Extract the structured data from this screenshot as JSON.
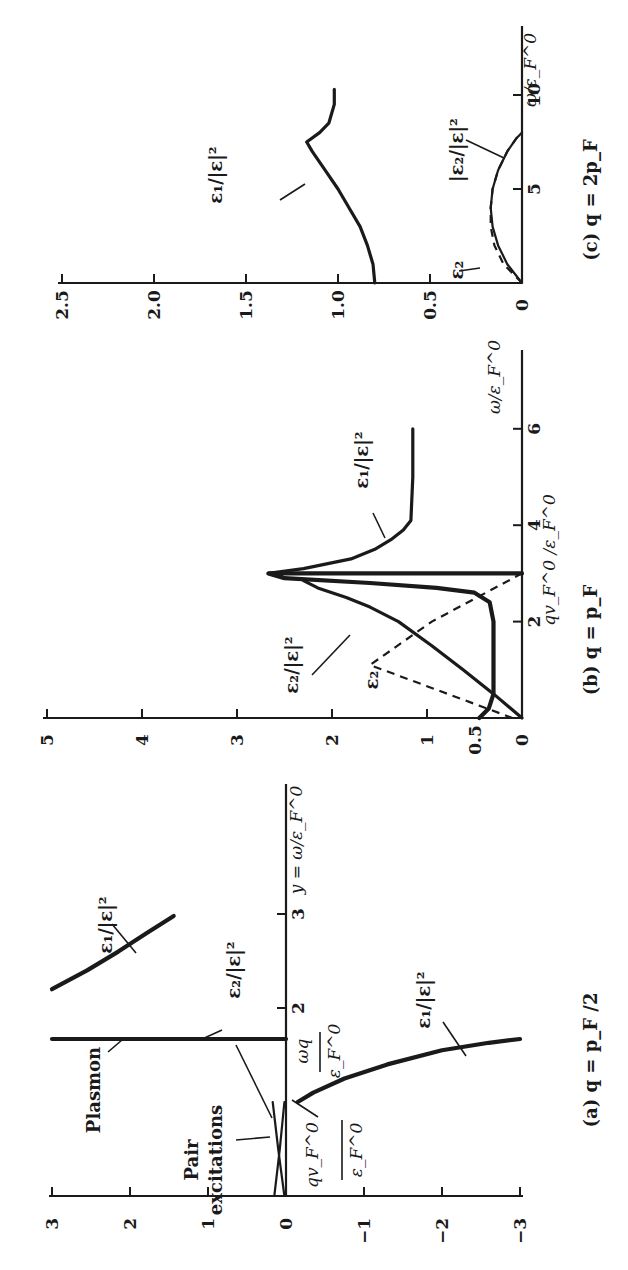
{
  "chart_data": [
    {
      "type": "line",
      "panel": "c",
      "title": "(c) q = 2p_F",
      "xlabel": "ω/ε_F^0",
      "ylabel": "",
      "xlim": [
        0,
        13.5
      ],
      "ylim": [
        0,
        2.5
      ],
      "x_ticks": [
        5,
        10
      ],
      "y_ticks": [
        "0",
        "0.5",
        "1.0",
        "1.5",
        "2.0",
        "2.5"
      ],
      "grid": false,
      "series": [
        {
          "name": "ε₁/|ε|²",
          "style": "solid",
          "x": [
            0,
            1,
            2,
            3,
            4,
            5,
            6,
            7,
            7.5,
            8.0,
            8.5,
            9.5,
            10.3
          ],
          "y": [
            0.8,
            0.81,
            0.84,
            0.88,
            0.94,
            1.0,
            1.07,
            1.14,
            1.17,
            1.1,
            1.05,
            1.02,
            1.02
          ]
        },
        {
          "name": "ε₂/|ε|²",
          "style": "solid",
          "x": [
            0,
            1,
            2,
            3,
            4,
            5,
            6,
            7,
            7.7,
            8.0
          ],
          "y": [
            0,
            0.08,
            0.13,
            0.16,
            0.17,
            0.16,
            0.13,
            0.08,
            0.03,
            0
          ]
        },
        {
          "name": "ε₂",
          "style": "dashed",
          "x": [
            0,
            1,
            2,
            3,
            4,
            5,
            6,
            7,
            7.7,
            8.0
          ],
          "y": [
            0,
            0.1,
            0.15,
            0.17,
            0.17,
            0.16,
            0.13,
            0.08,
            0.03,
            0
          ]
        }
      ],
      "annotations": [
        "ε₁/|ε|²",
        "|ε₂/|ε|²",
        "ε₂"
      ]
    },
    {
      "type": "line",
      "panel": "b",
      "title": "(b) q = p_F",
      "xlabel": "ω/ε_F^0",
      "ylabel": "",
      "xlim": [
        0,
        8
      ],
      "ylim": [
        0,
        5
      ],
      "x_ticks": [
        2,
        4,
        6
      ],
      "y_ticks": [
        "0",
        "0.5",
        "1",
        "2",
        "3",
        "4",
        "5"
      ],
      "grid": false,
      "series": [
        {
          "name": "ε₁/|ε|² (ω < qv_F)",
          "style": "solid",
          "x": [
            0,
            0.2,
            0.5,
            1.0,
            1.5,
            2.0,
            2.4,
            2.6,
            2.7,
            2.8,
            2.9,
            3.0,
            3.0
          ],
          "y": [
            0.45,
            0.35,
            0.3,
            0.3,
            0.3,
            0.3,
            0.34,
            0.5,
            0.9,
            1.6,
            2.5,
            2.67,
            0
          ]
        },
        {
          "name": "ε₁/|ε|² (ω > qv_F)",
          "style": "solid",
          "x": [
            3.0,
            3.1,
            3.3,
            3.5,
            3.7,
            3.9,
            4.1,
            5.0,
            6.0
          ],
          "y": [
            2.67,
            2.3,
            1.8,
            1.55,
            1.38,
            1.25,
            1.17,
            1.15,
            1.15
          ]
        },
        {
          "name": "ε₂/|ε|²",
          "style": "solid",
          "x": [
            0,
            0.5,
            1.0,
            1.5,
            2.0,
            2.3,
            2.5,
            2.7,
            2.85
          ],
          "y": [
            0,
            0.3,
            0.62,
            0.95,
            1.3,
            1.6,
            1.85,
            2.15,
            2.3
          ]
        },
        {
          "name": "ε₂",
          "style": "dashed",
          "x": [
            0,
            1.1,
            2.0,
            3.0
          ],
          "y": [
            0.1,
            1.6,
            0.95,
            0
          ]
        }
      ],
      "annotations": [
        "ε₁/|ε|²",
        "ε₂/|ε|²",
        "ε₂",
        "qv_F^0/ε_F^0"
      ]
    },
    {
      "type": "line",
      "panel": "a",
      "title": "(a) q = p_F/2",
      "xlabel": "y = ω/ε_F^0",
      "ylabel": "",
      "xlim": [
        0,
        4.3
      ],
      "ylim": [
        -3,
        3
      ],
      "x_ticks": [
        2,
        3
      ],
      "y_ticks": [
        "3",
        "2",
        "1",
        "0",
        "−1",
        "−2",
        "−3"
      ],
      "grid": false,
      "series": [
        {
          "name": "ε₁/|ε|² (upper branch)",
          "style": "solid",
          "x": [
            2.2,
            2.4,
            2.6,
            2.8,
            2.98
          ],
          "y": [
            3.0,
            2.55,
            2.15,
            1.78,
            1.44
          ]
        },
        {
          "name": "ε₁/|ε|² (lower branch)",
          "style": "solid",
          "x": [
            1.0,
            1.1,
            1.25,
            1.4,
            1.55,
            1.63,
            1.67
          ],
          "y": [
            -0.15,
            -0.35,
            -0.75,
            -1.3,
            -2.0,
            -2.6,
            -3.0
          ]
        },
        {
          "name": "ε₂/|ε|² (plasmon)",
          "style": "solid",
          "x": [
            1.67,
            1.67
          ],
          "y": [
            0,
            3.0
          ]
        },
        {
          "name": "pair excitations ε₁/|ε|²",
          "style": "solid",
          "x": [
            0,
            0.5,
            1.0
          ],
          "y": [
            0.15,
            0.08,
            0.02
          ]
        },
        {
          "name": "pair excitations ε₂/|ε|²",
          "style": "solid",
          "x": [
            0,
            0.5,
            1.0
          ],
          "y": [
            0.02,
            0.1,
            0.17
          ]
        }
      ],
      "annotations": [
        "Plasmon",
        "Pair excitations",
        "ε₁/|ε|²",
        "ε₂/|ε|²",
        "ω_q/ε_F^0",
        "qv_F^0/ε_F^0"
      ]
    }
  ],
  "panels": {
    "c": {
      "caption": "(c) q = 2p_F",
      "freq_label": "ω/ε_F^0",
      "labels": {
        "e1": "ε₁/|ε|²",
        "e2ratio": "|ε₂/|ε|²",
        "e2": "ε₂"
      }
    },
    "b": {
      "caption": "(b) q = p_F",
      "freq_label": "ω/ε_F^0",
      "qv_label": "qv_F^0 /ε_F^0",
      "labels": {
        "e1": "ε₁/|ε|²",
        "e2ratio": "ε₂/|ε|²",
        "e2": "ε₂"
      }
    },
    "a": {
      "caption": "(a) q = p_F /2",
      "freq_label": "y = ω/ε_F^0",
      "labels": {
        "plasmon": "Plasmon",
        "pair1": "Pair",
        "pair2": "excitations",
        "e1_upper": "ε₁/|ε|²",
        "e1_lower": "ε₁/|ε|²",
        "e2ratio": "ε₂/|ε|²",
        "wq_num": "ωq",
        "wq_den": "ε_F^0",
        "qv_num": "qv_F^0",
        "qv_den": "ε_F^0"
      }
    }
  }
}
